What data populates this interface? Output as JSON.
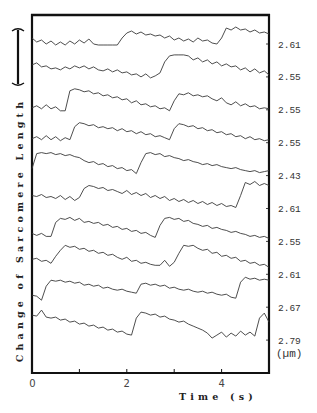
{
  "figure": {
    "y_axis_label": "Change of Sarcomere Length",
    "x_axis_label": "Time (s)",
    "unit_label": "(µm)",
    "x_tick_labels": [
      {
        "t": 0,
        "label": "0"
      },
      {
        "t": 2,
        "label": "2"
      },
      {
        "t": 4,
        "label": "4"
      }
    ]
  },
  "chart_data": {
    "type": "line",
    "title": "",
    "xlabel": "Time (s)",
    "ylabel": "Change of Sarcomere Length",
    "xlim": [
      0,
      5
    ],
    "x_ticks": [
      0,
      1,
      2,
      3,
      4,
      5
    ],
    "x_tick_labels": [
      "0",
      "",
      "2",
      "",
      "4",
      ""
    ],
    "x_step": 0.1,
    "grid": false,
    "legend": "none; each trace labeled at right with its sarcomere length",
    "unit": "µm",
    "scale_bar": "unlabeled vertical bar, top-left",
    "series": [
      {
        "name": "2.61",
        "values": [
          6,
          2,
          4,
          0,
          3,
          -1,
          2,
          -1,
          3,
          0,
          4,
          1,
          5,
          0,
          -1,
          -1,
          -1,
          -1,
          -1,
          6,
          11,
          13,
          10,
          12,
          9,
          10,
          8,
          9,
          6,
          8,
          4,
          6,
          3,
          5,
          2,
          6,
          3,
          4,
          1,
          0,
          6,
          16,
          14,
          17,
          14,
          15,
          12,
          14,
          11,
          12,
          10
        ]
      },
      {
        "name": "2.55",
        "values": [
          12,
          14,
          10,
          11,
          8,
          9,
          7,
          10,
          8,
          11,
          9,
          11,
          8,
          10,
          7,
          6,
          8,
          5,
          7,
          4,
          5,
          2,
          3,
          0,
          3,
          -1,
          1,
          4,
          15,
          21,
          22,
          22,
          22,
          21,
          17,
          19,
          15,
          17,
          13,
          15,
          11,
          13,
          10,
          11,
          7,
          9,
          5,
          8,
          4,
          6,
          2
        ]
      },
      {
        "name": "2.55",
        "values": [
          2,
          4,
          1,
          5,
          1,
          3,
          -1,
          -1,
          19,
          21,
          20,
          18,
          19,
          16,
          17,
          14,
          15,
          12,
          13,
          10,
          11,
          7,
          9,
          5,
          6,
          3,
          4,
          1,
          2,
          -1,
          9,
          16,
          15,
          17,
          14,
          15,
          13,
          14,
          11,
          9,
          12,
          7,
          5,
          8,
          4,
          6,
          3,
          4,
          1,
          2,
          1
        ]
      },
      {
        "name": "2.55",
        "values": [
          4,
          6,
          3,
          7,
          3,
          6,
          2,
          5,
          3,
          16,
          20,
          19,
          17,
          18,
          15,
          16,
          14,
          15,
          12,
          14,
          11,
          12,
          9,
          11,
          8,
          9,
          6,
          7,
          5,
          3,
          14,
          19,
          18,
          16,
          17,
          14,
          15,
          12,
          13,
          10,
          11,
          8,
          9,
          6,
          7,
          4,
          6,
          3,
          4,
          2,
          3
        ]
      },
      {
        "name": "2.43",
        "values": [
          7,
          22,
          23,
          22,
          23,
          21,
          22,
          20,
          21,
          19,
          18,
          15,
          13,
          14,
          11,
          12,
          9,
          10,
          7,
          8,
          5,
          6,
          2,
          13,
          22,
          23,
          21,
          22,
          19,
          20,
          18,
          17,
          15,
          16,
          14,
          13,
          11,
          12,
          10,
          11,
          9,
          8,
          7,
          8,
          6,
          5,
          4,
          5,
          3,
          4,
          5
        ]
      },
      {
        "name": "2.61",
        "values": [
          13,
          12,
          14,
          11,
          12,
          10,
          13,
          9,
          12,
          8,
          11,
          20,
          23,
          22,
          20,
          21,
          18,
          19,
          17,
          15,
          18,
          14,
          16,
          13,
          15,
          11,
          13,
          10,
          12,
          8,
          10,
          7,
          9,
          6,
          8,
          5,
          7,
          4,
          6,
          3,
          5,
          2,
          3,
          1,
          13,
          26,
          24,
          27,
          23,
          25,
          23
        ]
      },
      {
        "name": "2.55",
        "values": [
          8,
          6,
          8,
          5,
          5,
          19,
          23,
          22,
          24,
          21,
          23,
          19,
          20,
          18,
          19,
          16,
          17,
          14,
          15,
          12,
          13,
          10,
          11,
          8,
          9,
          6,
          4,
          16,
          23,
          24,
          22,
          23,
          20,
          21,
          18,
          17,
          15,
          16,
          13,
          14,
          12,
          11,
          9,
          10,
          8,
          7,
          5,
          6,
          4,
          5,
          3
        ]
      },
      {
        "name": "2.61",
        "values": [
          15,
          16,
          13,
          14,
          11,
          18,
          24,
          29,
          27,
          28,
          25,
          26,
          23,
          24,
          21,
          22,
          19,
          20,
          17,
          15,
          17,
          13,
          14,
          11,
          12,
          10,
          9,
          9,
          14,
          8,
          12,
          21,
          29,
          28,
          29,
          26,
          24,
          25,
          21,
          22,
          18,
          19,
          16,
          17,
          13,
          14,
          11,
          12,
          9,
          10,
          7
        ]
      },
      {
        "name": "2.67",
        "values": [
          12,
          11,
          7,
          21,
          27,
          26,
          27,
          25,
          26,
          24,
          25,
          22,
          23,
          21,
          22,
          19,
          20,
          18,
          17,
          18,
          16,
          15,
          14,
          23,
          24,
          22,
          23,
          21,
          22,
          19,
          20,
          18,
          17,
          18,
          16,
          15,
          16,
          14,
          15,
          13,
          12,
          13,
          10,
          9,
          25,
          30,
          28,
          29,
          27,
          28,
          27
        ]
      },
      {
        "name": "2.79",
        "values": [
          25,
          24,
          30,
          23,
          22,
          23,
          20,
          21,
          18,
          19,
          16,
          17,
          14,
          15,
          12,
          13,
          10,
          11,
          8,
          9,
          6,
          5,
          22,
          28,
          27,
          25,
          26,
          23,
          24,
          21,
          20,
          18,
          19,
          16,
          14,
          12,
          10,
          7,
          2,
          5,
          8,
          3,
          7,
          4,
          9,
          5,
          8,
          4,
          22,
          27,
          18
        ]
      }
    ]
  }
}
